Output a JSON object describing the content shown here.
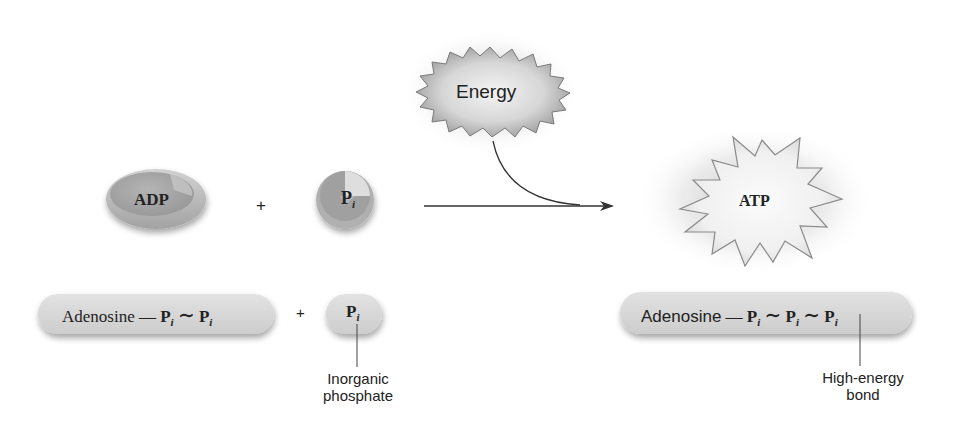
{
  "diagram": {
    "energy": {
      "label": "Energy"
    },
    "reactants": {
      "adp": {
        "label": "ADP"
      },
      "plus": "+",
      "pi": {
        "symbol": "P",
        "subscript": "i"
      }
    },
    "product": {
      "atp": {
        "label": "ATP"
      }
    },
    "formula_left": {
      "adenosine": "Adenosine",
      "single_bond": "—",
      "high_bond": "∼",
      "p1": "P",
      "p1_sub": "i",
      "p2": "P",
      "p2_sub": "i",
      "plus": "+",
      "pi": "P",
      "pi_sub": "i"
    },
    "formula_right": {
      "adenosine": "Adenosine",
      "single_bond": "—",
      "high_bond_1": "∼",
      "high_bond_2": "∼",
      "p1": "P",
      "p1_sub": "i",
      "p2": "P",
      "p2_sub": "i",
      "p3": "P",
      "p3_sub": "i"
    },
    "callouts": {
      "inorganic_line1": "Inorganic",
      "inorganic_line2": "phosphate",
      "bond_line1": "High-energy",
      "bond_line2": "bond"
    },
    "colors": {
      "shape_fill": "#c8c8c8",
      "shape_dark": "#8f8f8f",
      "pill_fill": "#d9d9d9",
      "arrow": "#333333",
      "text": "#222222"
    }
  }
}
